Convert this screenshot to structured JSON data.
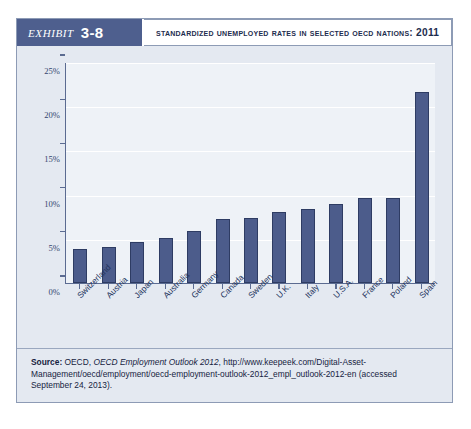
{
  "exhibit": {
    "word": "Exhibit",
    "number": "3-8",
    "title": "Standardized Unemployed Rates in Selected OECD Nations: 2011"
  },
  "source": {
    "label": "Source:",
    "publisher": "OECD,",
    "publication": "OECD Employment Outlook 2012",
    "rest": ", http://www.keepeek.com/Digital-Asset-Management/oecd/employment/oecd-employment-outlook-2012_empl_outlook-2012-en (accessed September 24, 2013)."
  },
  "colors": {
    "bar": "#4c5c8b",
    "panel": "#e4e9f1",
    "plot_bg": "#eef2f7",
    "header": "#4e5f8e",
    "axis": "#5b6b91"
  },
  "chart_data": {
    "type": "bar",
    "title": "Standardized Unemployed Rates in Selected OECD Nations: 2011",
    "xlabel": "",
    "ylabel": "",
    "ylim": [
      0,
      25
    ],
    "ytick_labels": [
      "0%",
      "5%",
      "10%",
      "15%",
      "20%",
      "25%"
    ],
    "ytick_values": [
      0,
      5,
      10,
      15,
      20,
      25
    ],
    "grid": true,
    "legend": "none",
    "categories": [
      "Switzerland",
      "Austria",
      "Japan",
      "Australia",
      "Germany",
      "Canada",
      "Sweden",
      "U.K.",
      "Italy",
      "U.S.A.",
      "France",
      "Poland",
      "Spain"
    ],
    "values": [
      3.9,
      4.1,
      4.6,
      5.1,
      5.9,
      7.2,
      7.4,
      8.0,
      8.4,
      8.9,
      9.6,
      9.6,
      21.6
    ]
  }
}
